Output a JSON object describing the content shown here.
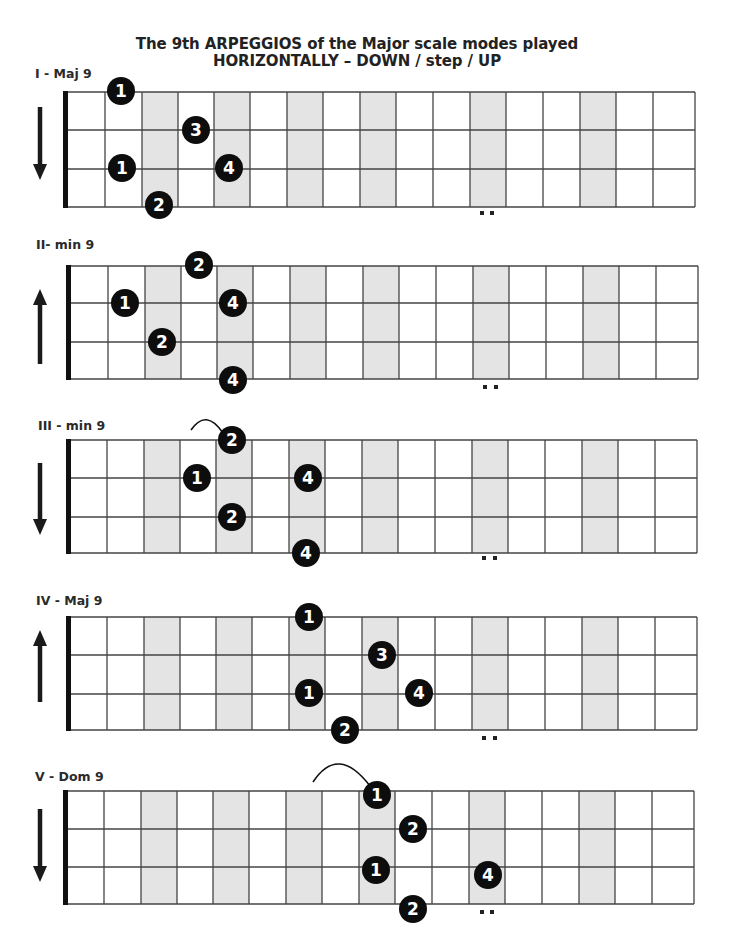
{
  "title": {
    "line1": "The 9th ARPEGGIOS of the Major scale modes played",
    "line2": "HORIZONTALLY – DOWN / step / UP"
  },
  "colors": {
    "grid_line": "#444444",
    "nut": "#111111",
    "shade": "#e4e4e4",
    "dot_fill": "#0d0d0d",
    "dot_text": "#ffffff",
    "arrow": "#1a1a1a"
  },
  "grid": {
    "fret_lines_x": [
      105,
      142,
      178,
      214,
      250,
      287,
      323,
      360,
      396,
      433,
      470,
      506,
      543,
      580,
      616,
      653
    ],
    "shaded_columns": [
      [
        142,
        178
      ],
      [
        214,
        250
      ],
      [
        287,
        323
      ],
      [
        360,
        396
      ],
      [
        470,
        506
      ],
      [
        580,
        616
      ]
    ],
    "string_count": 4
  },
  "diagrams": [
    {
      "label": "I - Maj 9",
      "label_pos": [
        35,
        66
      ],
      "x_offset": 0,
      "nut_x": 63,
      "right_x": 695,
      "strings_y": [
        92,
        130,
        169,
        207
      ],
      "direction": "down",
      "arrow": {
        "x": 40,
        "y1": 107,
        "y2": 180
      },
      "double_dot": {
        "x": [
          482,
          492
        ],
        "y": 213
      },
      "notes": [
        {
          "finger": "1",
          "x": 121,
          "y": 91
        },
        {
          "finger": "3",
          "x": 196,
          "y": 130
        },
        {
          "finger": "1",
          "x": 122,
          "y": 168
        },
        {
          "finger": "4",
          "x": 229,
          "y": 168
        },
        {
          "finger": "2",
          "x": 159,
          "y": 205
        }
      ],
      "slide": null
    },
    {
      "label": "II- min 9",
      "label_pos": [
        36,
        237
      ],
      "x_offset": 3,
      "nut_x": 66,
      "right_x": 698,
      "strings_y": [
        266,
        303,
        342,
        379
      ],
      "direction": "up",
      "arrow": {
        "x": 40,
        "y1": 364,
        "y2": 289
      },
      "double_dot": {
        "x": [
          485,
          496
        ],
        "y": 387
      },
      "notes": [
        {
          "finger": "2",
          "x": 199,
          "y": 265
        },
        {
          "finger": "1",
          "x": 125,
          "y": 303
        },
        {
          "finger": "4",
          "x": 233,
          "y": 303
        },
        {
          "finger": "2",
          "x": 162,
          "y": 342
        },
        {
          "finger": "4",
          "x": 233,
          "y": 380
        }
      ],
      "slide": null
    },
    {
      "label": "III - min 9",
      "label_pos": [
        38,
        418
      ],
      "x_offset": 2,
      "nut_x": 66,
      "right_x": 697,
      "strings_y": [
        440,
        478,
        517,
        553
      ],
      "direction": "down",
      "arrow": {
        "x": 40,
        "y1": 463,
        "y2": 535
      },
      "double_dot": {
        "x": [
          484,
          495
        ],
        "y": 558
      },
      "notes": [
        {
          "finger": "2",
          "x": 232,
          "y": 440
        },
        {
          "finger": "1",
          "x": 197,
          "y": 478
        },
        {
          "finger": "4",
          "x": 308,
          "y": 478
        },
        {
          "finger": "2",
          "x": 232,
          "y": 517
        },
        {
          "finger": "4",
          "x": 306,
          "y": 553
        }
      ],
      "slide": {
        "x1": 191,
        "y1": 430,
        "x2": 223,
        "y2": 433,
        "cx": 206,
        "cy": 416
      }
    },
    {
      "label": "IV - Maj 9",
      "label_pos": [
        36,
        593
      ],
      "x_offset": 2,
      "nut_x": 66,
      "right_x": 697,
      "strings_y": [
        617,
        655,
        694,
        730
      ],
      "direction": "up",
      "arrow": {
        "x": 40,
        "y1": 702,
        "y2": 630
      },
      "double_dot": {
        "x": [
          484,
          495
        ],
        "y": 738
      },
      "notes": [
        {
          "finger": "1",
          "x": 309,
          "y": 617
        },
        {
          "finger": "3",
          "x": 382,
          "y": 655
        },
        {
          "finger": "1",
          "x": 309,
          "y": 693
        },
        {
          "finger": "4",
          "x": 419,
          "y": 693
        },
        {
          "finger": "2",
          "x": 345,
          "y": 730
        }
      ],
      "slide": null
    },
    {
      "label": "V - Dom 9",
      "label_pos": [
        35,
        769
      ],
      "x_offset": -1,
      "nut_x": 63,
      "right_x": 694,
      "strings_y": [
        791,
        829,
        867,
        904
      ],
      "direction": "down",
      "arrow": {
        "x": 40,
        "y1": 809,
        "y2": 882
      },
      "double_dot": {
        "x": [
          482,
          492
        ],
        "y": 912
      },
      "notes": [
        {
          "finger": "1",
          "x": 377,
          "y": 795
        },
        {
          "finger": "2",
          "x": 413,
          "y": 829
        },
        {
          "finger": "1",
          "x": 376,
          "y": 870
        },
        {
          "finger": "4",
          "x": 488,
          "y": 875
        },
        {
          "finger": "2",
          "x": 413,
          "y": 909
        }
      ],
      "slide": {
        "x1": 313,
        "y1": 782,
        "x2": 370,
        "y2": 786,
        "cx": 338,
        "cy": 752
      }
    }
  ]
}
